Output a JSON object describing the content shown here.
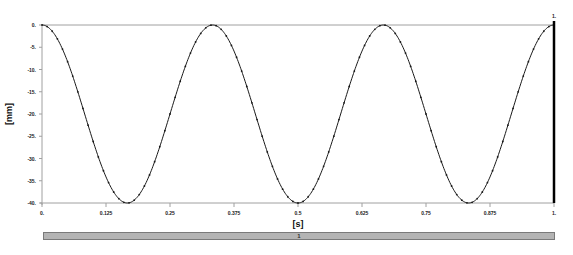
{
  "chart_data": {
    "type": "line",
    "title": "",
    "xlabel": "[s]",
    "ylabel": "[mm]",
    "xlim": [
      0,
      1
    ],
    "ylim": [
      -40,
      0
    ],
    "grid": false,
    "legend": null,
    "x_ticks": [
      "0.",
      "0.125",
      "0.25",
      "0.375",
      "0.5",
      "0.625",
      "0.75",
      "0.875",
      "1."
    ],
    "y_ticks": [
      "0.",
      "-5.",
      "-10.",
      "-15.",
      "-20.",
      "-25.",
      "-30.",
      "-35.",
      "-40."
    ],
    "series": [
      {
        "name": "displacement",
        "color": "#1a1a1a",
        "markers": true,
        "description": "cosine wave y = -20*(1 - cos(2*pi*3*t)), 3 cycles between 0 and -40 mm over 0..1 s, sampled every 0.01 s",
        "x": [
          0,
          0.0833,
          0.1667,
          0.25,
          0.3333,
          0.4167,
          0.5,
          0.5833,
          0.6667,
          0.75,
          0.8333,
          0.9167,
          1.0
        ],
        "values": [
          0,
          -20,
          -40,
          -20,
          0,
          -20,
          -40,
          -20,
          0,
          -20,
          -40,
          -20,
          0
        ]
      }
    ],
    "annotations": [
      {
        "type": "cursor-line",
        "x": 1.0,
        "label": "1.",
        "color": "#000000"
      }
    ]
  },
  "timeline": {
    "label": "1"
  },
  "colors": {
    "axis": "#a0a0a0",
    "curve": "#1a1a1a",
    "cursor": "#000000",
    "timeline_fill": "#b4b4b4"
  }
}
